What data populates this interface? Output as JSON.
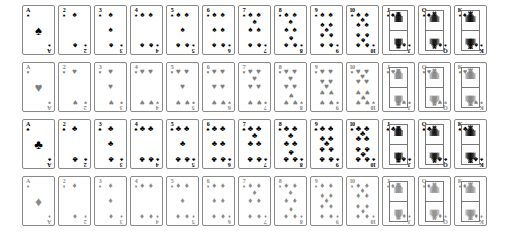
{
  "deck": {
    "title": "Standard 52-card deck",
    "background_color": "#ffffff",
    "card_border_color": "#8a8a8a",
    "ranks": [
      "A",
      "2",
      "3",
      "4",
      "5",
      "6",
      "7",
      "8",
      "9",
      "10",
      "J",
      "Q",
      "K"
    ],
    "court_ranks": [
      "J",
      "Q",
      "K"
    ],
    "suits": [
      {
        "name": "spades",
        "symbol": "♠",
        "color": "#000000",
        "row_index": 0,
        "cards": [
          {
            "rank": "A",
            "label": "Ace of Spades"
          },
          {
            "rank": "2",
            "label": "Two of Spades"
          },
          {
            "rank": "3",
            "label": "Three of Spades"
          },
          {
            "rank": "4",
            "label": "Four of Spades"
          },
          {
            "rank": "5",
            "label": "Five of Spades"
          },
          {
            "rank": "6",
            "label": "Six of Spades"
          },
          {
            "rank": "7",
            "label": "Seven of Spades"
          },
          {
            "rank": "8",
            "label": "Eight of Spades"
          },
          {
            "rank": "9",
            "label": "Nine of Spades"
          },
          {
            "rank": "10",
            "label": "Ten of Spades"
          },
          {
            "rank": "J",
            "label": "Jack of Spades"
          },
          {
            "rank": "Q",
            "label": "Queen of Spades"
          },
          {
            "rank": "K",
            "label": "King of Spades"
          }
        ]
      },
      {
        "name": "hearts",
        "symbol": "♥",
        "color": "#808080",
        "row_index": 1,
        "cards": [
          {
            "rank": "A",
            "label": "Ace of Hearts"
          },
          {
            "rank": "2",
            "label": "Two of Hearts"
          },
          {
            "rank": "3",
            "label": "Three of Hearts"
          },
          {
            "rank": "4",
            "label": "Four of Hearts"
          },
          {
            "rank": "5",
            "label": "Five of Hearts"
          },
          {
            "rank": "6",
            "label": "Six of Hearts"
          },
          {
            "rank": "7",
            "label": "Seven of Hearts"
          },
          {
            "rank": "8",
            "label": "Eight of Hearts"
          },
          {
            "rank": "9",
            "label": "Nine of Hearts"
          },
          {
            "rank": "10",
            "label": "Ten of Hearts"
          },
          {
            "rank": "J",
            "label": "Jack of Hearts"
          },
          {
            "rank": "Q",
            "label": "Queen of Hearts"
          },
          {
            "rank": "K",
            "label": "King of Hearts"
          }
        ]
      },
      {
        "name": "clubs",
        "symbol": "♣",
        "color": "#000000",
        "row_index": 2,
        "cards": [
          {
            "rank": "A",
            "label": "Ace of Clubs"
          },
          {
            "rank": "2",
            "label": "Two of Clubs"
          },
          {
            "rank": "3",
            "label": "Three of Clubs"
          },
          {
            "rank": "4",
            "label": "Four of Clubs"
          },
          {
            "rank": "5",
            "label": "Five of Clubs"
          },
          {
            "rank": "6",
            "label": "Six of Clubs"
          },
          {
            "rank": "7",
            "label": "Seven of Clubs"
          },
          {
            "rank": "8",
            "label": "Eight of Clubs"
          },
          {
            "rank": "9",
            "label": "Nine of Clubs"
          },
          {
            "rank": "10",
            "label": "Ten of Clubs"
          },
          {
            "rank": "J",
            "label": "Jack of Clubs"
          },
          {
            "rank": "Q",
            "label": "Queen of Clubs"
          },
          {
            "rank": "K",
            "label": "King of Clubs"
          }
        ]
      },
      {
        "name": "diamonds",
        "symbol": "♦",
        "color": "#8a8a8a",
        "row_index": 3,
        "cards": [
          {
            "rank": "A",
            "label": "Ace of Diamonds"
          },
          {
            "rank": "2",
            "label": "Two of Diamonds"
          },
          {
            "rank": "3",
            "label": "Three of Diamonds"
          },
          {
            "rank": "4",
            "label": "Four of Diamonds"
          },
          {
            "rank": "5",
            "label": "Five of Diamonds"
          },
          {
            "rank": "6",
            "label": "Six of Diamonds"
          },
          {
            "rank": "7",
            "label": "Seven of Diamonds"
          },
          {
            "rank": "8",
            "label": "Eight of Diamonds"
          },
          {
            "rank": "9",
            "label": "Nine of Diamonds"
          },
          {
            "rank": "10",
            "label": "Ten of Diamonds"
          },
          {
            "rank": "J",
            "label": "Jack of Diamonds"
          },
          {
            "rank": "Q",
            "label": "Queen of Diamonds"
          },
          {
            "rank": "K",
            "label": "King of Diamonds"
          }
        ]
      }
    ],
    "pip_layouts": {
      "A": [
        [
          50,
          50,
          "big",
          false
        ]
      ],
      "2": [
        [
          50,
          14,
          "",
          false
        ],
        [
          50,
          86,
          "",
          true
        ]
      ],
      "3": [
        [
          50,
          14,
          "",
          false
        ],
        [
          50,
          50,
          "",
          false
        ],
        [
          50,
          86,
          "",
          true
        ]
      ],
      "4": [
        [
          22,
          14,
          "",
          false
        ],
        [
          78,
          14,
          "",
          false
        ],
        [
          22,
          86,
          "",
          true
        ],
        [
          78,
          86,
          "",
          true
        ]
      ],
      "5": [
        [
          22,
          14,
          "",
          false
        ],
        [
          78,
          14,
          "",
          false
        ],
        [
          50,
          50,
          "",
          false
        ],
        [
          22,
          86,
          "",
          true
        ],
        [
          78,
          86,
          "",
          true
        ]
      ],
      "6": [
        [
          22,
          14,
          "",
          false
        ],
        [
          78,
          14,
          "",
          false
        ],
        [
          22,
          50,
          "",
          false
        ],
        [
          78,
          50,
          "",
          false
        ],
        [
          22,
          86,
          "",
          true
        ],
        [
          78,
          86,
          "",
          true
        ]
      ],
      "7": [
        [
          22,
          14,
          "",
          false
        ],
        [
          78,
          14,
          "",
          false
        ],
        [
          50,
          32,
          "",
          false
        ],
        [
          22,
          50,
          "",
          false
        ],
        [
          78,
          50,
          "",
          false
        ],
        [
          22,
          86,
          "",
          true
        ],
        [
          78,
          86,
          "",
          true
        ]
      ],
      "8": [
        [
          22,
          14,
          "",
          false
        ],
        [
          78,
          14,
          "",
          false
        ],
        [
          50,
          32,
          "",
          false
        ],
        [
          22,
          50,
          "",
          false
        ],
        [
          78,
          50,
          "",
          false
        ],
        [
          50,
          68,
          "",
          true
        ],
        [
          22,
          86,
          "",
          true
        ],
        [
          78,
          86,
          "",
          true
        ]
      ],
      "9": [
        [
          22,
          14,
          "",
          false
        ],
        [
          78,
          14,
          "",
          false
        ],
        [
          22,
          38,
          "",
          false
        ],
        [
          78,
          38,
          "",
          false
        ],
        [
          50,
          50,
          "",
          false
        ],
        [
          22,
          62,
          "",
          true
        ],
        [
          78,
          62,
          "",
          true
        ],
        [
          22,
          86,
          "",
          true
        ],
        [
          78,
          86,
          "",
          true
        ]
      ],
      "10": [
        [
          22,
          14,
          "",
          false
        ],
        [
          78,
          14,
          "",
          false
        ],
        [
          50,
          26,
          "",
          false
        ],
        [
          22,
          38,
          "",
          false
        ],
        [
          78,
          38,
          "",
          false
        ],
        [
          22,
          62,
          "",
          true
        ],
        [
          78,
          62,
          "",
          true
        ],
        [
          50,
          74,
          "",
          true
        ],
        [
          22,
          86,
          "",
          true
        ],
        [
          78,
          86,
          "",
          true
        ]
      ]
    }
  }
}
